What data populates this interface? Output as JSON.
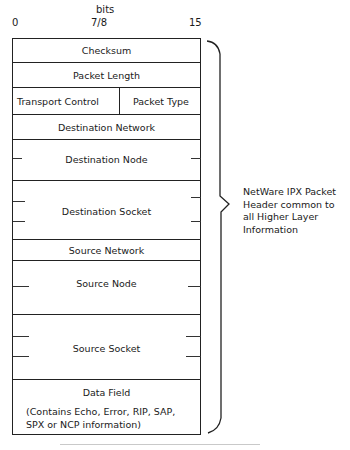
{
  "diagram": {
    "type": "packet-header-layout",
    "bit_axis": {
      "title": "bits",
      "start": "0",
      "middle": "7/8",
      "end": "15"
    },
    "fields": [
      {
        "name": "Checksum"
      },
      {
        "name": "Packet Length"
      },
      {
        "name_left": "Transport Control",
        "name_right": "Packet Type"
      },
      {
        "name": "Destination Network"
      },
      {
        "name": "Destination Node"
      },
      {
        "name": "Destination Socket"
      },
      {
        "name": "Source Network"
      },
      {
        "name": "Source Node"
      },
      {
        "name": "Source Socket"
      },
      {
        "name": "Data Field",
        "detail_line1": "(Contains Echo, Error, RIP, SAP,",
        "detail_line2": "SPX or NCP information)"
      }
    ],
    "brace_annotation": {
      "line1": "NetWare IPX Packet",
      "line2": "Header common to",
      "line3": "all Higher Layer",
      "line4": "Information"
    }
  }
}
